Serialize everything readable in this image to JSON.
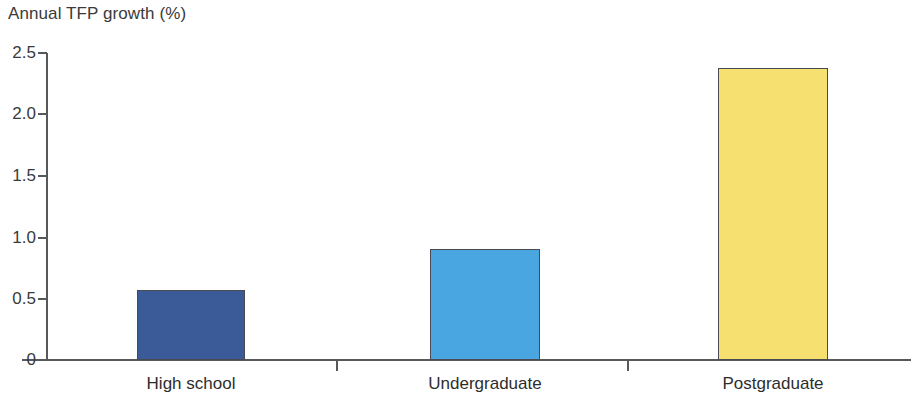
{
  "chart_data": {
    "type": "bar",
    "title": "Annual TFP growth (%)",
    "xlabel": "",
    "ylabel": "",
    "categories": [
      "High school",
      "Undergraduate",
      "Postgraduate"
    ],
    "values": [
      0.57,
      0.9,
      2.38
    ],
    "series": [
      {
        "name": "Annual TFP growth",
        "values": [
          0.57,
          0.9,
          2.38
        ]
      }
    ],
    "bar_colors": [
      "#3b5a98",
      "#4aa6e0",
      "#f5e070"
    ],
    "bar_border_color": "#4a4a52",
    "ylim": [
      0,
      2.5
    ],
    "ytick_labels": [
      "0",
      "0.5",
      "1.0",
      "1.5",
      "2.0",
      "2.5"
    ],
    "ytick_values": [
      0,
      0.5,
      1.0,
      1.5,
      2.0,
      2.5
    ],
    "grid": false,
    "legend": false,
    "legend_position": "none",
    "axis_color": "#57585a",
    "text_color": "#3a3a3a",
    "background": "#ffffff"
  },
  "axes": {
    "y_ticks": [
      {
        "label": "2.5",
        "value": 2.5
      },
      {
        "label": "2.0",
        "value": 2.0
      },
      {
        "label": "1.5",
        "value": 1.5
      },
      {
        "label": "1.0",
        "value": 1.0
      },
      {
        "label": "0.5",
        "value": 0.5
      },
      {
        "label": "0",
        "value": 0
      }
    ],
    "x_categories": [
      {
        "label": "High school"
      },
      {
        "label": "Undergraduate"
      },
      {
        "label": "Postgraduate"
      }
    ]
  }
}
